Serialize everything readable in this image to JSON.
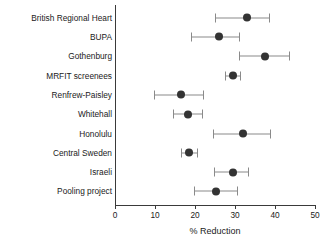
{
  "chart_data": {
    "type": "scatter",
    "title": "",
    "xlabel": "% Reduction",
    "ylabel": "",
    "xlim": [
      0,
      50
    ],
    "xticks": [
      0,
      10,
      20,
      30,
      40,
      50
    ],
    "xticklabels": [
      "0",
      "10",
      "20",
      "30",
      "40",
      "50"
    ],
    "grid": false,
    "legend": null,
    "orientation": "horizontal",
    "error_bars": "horizontal confidence intervals",
    "categories": [
      "British Regional Heart",
      "BUPA",
      "Gothenburg",
      "MRFIT screenees",
      "Renfrew-Paisley",
      "Whitehall",
      "Honolulu",
      "Central Sweden",
      "Israeli",
      "Pooling project"
    ],
    "points": [
      {
        "label": "British Regional Heart",
        "value": 33,
        "low": 25,
        "high": 38.5
      },
      {
        "label": "BUPA",
        "value": 26,
        "low": 19,
        "high": 31
      },
      {
        "label": "Gothenburg",
        "value": 37.5,
        "low": 31,
        "high": 43.5
      },
      {
        "label": "MRFIT screenees",
        "value": 29.5,
        "low": 27.5,
        "high": 31.2
      },
      {
        "label": "Renfrew-Paisley",
        "value": 16.5,
        "low": 9.8,
        "high": 22
      },
      {
        "label": "Whitehall",
        "value": 18.2,
        "low": 14.5,
        "high": 21.7
      },
      {
        "label": "Honolulu",
        "value": 32,
        "low": 24.5,
        "high": 38.8
      },
      {
        "label": "Central Sweden",
        "value": 18.5,
        "low": 16.5,
        "high": 20.5
      },
      {
        "label": "Israeli",
        "value": 29.6,
        "low": 24.8,
        "high": 33.3
      },
      {
        "label": "Pooling project",
        "value": 25.3,
        "low": 19.8,
        "high": 30.5
      }
    ],
    "colors": {
      "marker": "#333333",
      "whisker": "#8a8a8a",
      "axis": "#3a3a3a",
      "text": "#1a1a1a",
      "background": "#ffffff"
    }
  }
}
